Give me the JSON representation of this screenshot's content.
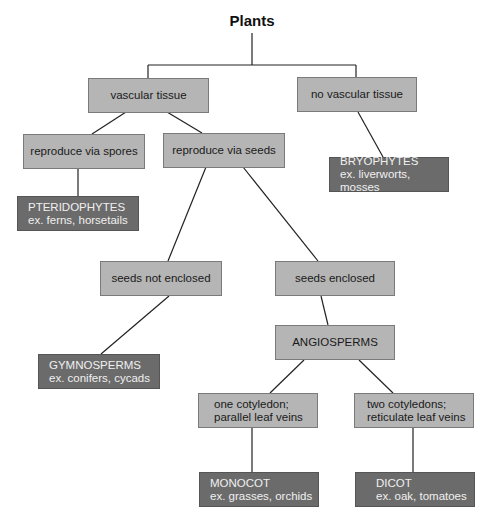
{
  "title": "Plants",
  "nodes": {
    "vascular": {
      "label": "vascular tissue"
    },
    "no_vascular": {
      "label": "no vascular tissue"
    },
    "spores": {
      "label": "reproduce via spores"
    },
    "seeds": {
      "label": "reproduce via seeds"
    },
    "pteridophytes": {
      "name": "PTERIDOPHYTES",
      "examples": "ex. ferns, horsetails"
    },
    "bryophytes": {
      "name": "BRYOPHYTES",
      "examples": "ex. liverworts, mosses"
    },
    "not_enclosed": {
      "label": "seeds not enclosed"
    },
    "enclosed": {
      "label": "seeds enclosed"
    },
    "gymnosperms": {
      "name": "GYMNOSPERMS",
      "examples": "ex. conifers, cycads"
    },
    "angiosperms": {
      "label": "ANGIOSPERMS"
    },
    "one_cot": {
      "line1": "one cotyledon;",
      "line2": "parallel leaf veins"
    },
    "two_cot": {
      "line1": "two cotyledons;",
      "line2": "reticulate leaf veins"
    },
    "monocot": {
      "name": "MONOCOT",
      "examples": "ex. grasses, orchids"
    },
    "dicot": {
      "name": "DICOT",
      "examples": "ex. oak, tomatoes"
    }
  },
  "colors": {
    "category_box": "#b5b5b5",
    "group_box": "#6b6b6b",
    "line": "#222222"
  }
}
